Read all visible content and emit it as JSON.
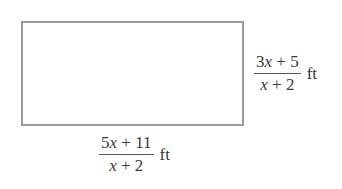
{
  "figure": {
    "shape": "rectangle",
    "height_label": {
      "numerator": "3x + 5",
      "denominator": "x + 2",
      "unit": "ft"
    },
    "width_label": {
      "numerator": "5x + 11",
      "denominator": "x + 2",
      "unit": "ft"
    },
    "colors": {
      "border": "#9a9a9a",
      "text": "#3a3a3a",
      "background": "#ffffff"
    }
  }
}
